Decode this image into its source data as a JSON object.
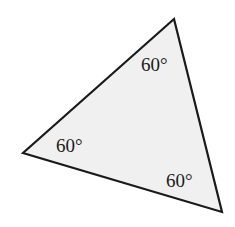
{
  "figure": {
    "kind": "geometry-diagram",
    "shape": "triangle",
    "background_color": "#ffffff",
    "fill_color": "#f0f0f0",
    "stroke_color": "#1a1a1a",
    "stroke_width": 2.2,
    "canvas": {
      "width": 235,
      "height": 227
    },
    "vertices": [
      {
        "name": "apex",
        "x": 174,
        "y": 19
      },
      {
        "name": "left",
        "x": 23,
        "y": 153
      },
      {
        "name": "bottom-right",
        "x": 222,
        "y": 212
      }
    ],
    "polygon_points": "174,19 23,153 222,212"
  },
  "labels": {
    "top": {
      "text": "60°",
      "x": 141,
      "y": 55,
      "vertex": "apex"
    },
    "left": {
      "text": "60°",
      "x": 56,
      "y": 136,
      "vertex": "left"
    },
    "bottom": {
      "text": "60°",
      "x": 166,
      "y": 171,
      "vertex": "bottom-right"
    }
  },
  "chart_data": {
    "type": "diagram",
    "title": "",
    "shape": "triangle",
    "annotations": [
      "60°",
      "60°",
      "60°"
    ],
    "angle_values_degrees": [
      60,
      60,
      60
    ],
    "angle_sum_degrees": 180
  }
}
